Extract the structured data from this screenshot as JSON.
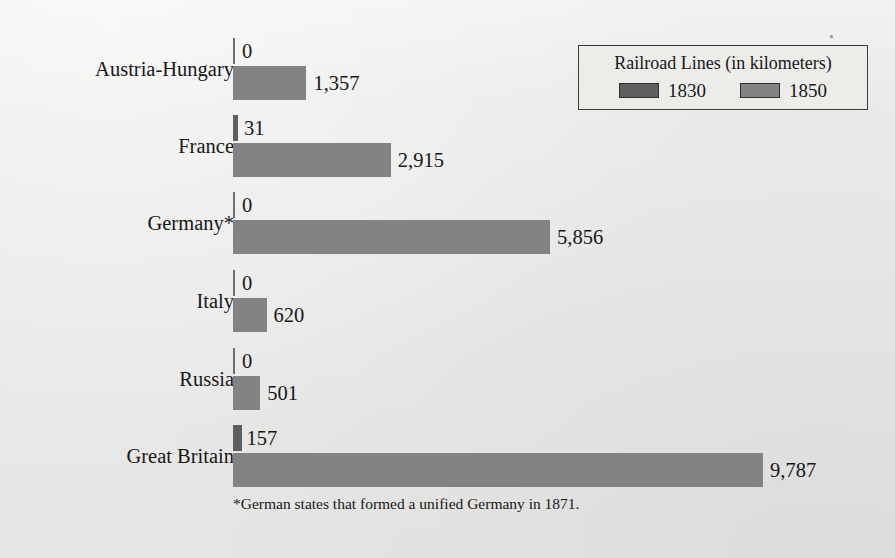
{
  "chart_data": {
    "type": "bar",
    "orientation": "horizontal",
    "title": "Railroad Lines (in kilometers)",
    "xlabel": "",
    "ylabel": "",
    "categories": [
      "Austria-Hungary",
      "France",
      "Germany*",
      "Italy",
      "Russia",
      "Great Britain"
    ],
    "series": [
      {
        "name": "1830",
        "color": "#5e5e5e",
        "values": [
          0,
          31,
          0,
          0,
          0,
          157
        ],
        "labels": [
          "0",
          "31",
          "0",
          "0",
          "0",
          "157"
        ]
      },
      {
        "name": "1850",
        "color": "#838383",
        "values": [
          1357,
          2915,
          5856,
          620,
          501,
          9787
        ],
        "labels": [
          "1,357",
          "2,915",
          "5,856",
          "620",
          "501",
          "9,787"
        ]
      }
    ],
    "xlim": [
      0,
      9787
    ],
    "grid": false,
    "legend_position": "top-right",
    "annotations": [
      "*German states that formed a unified Germany in 1871."
    ]
  },
  "legend": {
    "title": "Railroad Lines (in kilometers)",
    "entries": [
      {
        "label": "1830",
        "color": "#5e5e5e"
      },
      {
        "label": "1850",
        "color": "#838383"
      }
    ]
  },
  "footnote": "*German states that formed a unified Germany in 1871.",
  "colors": {
    "background": "#e9e9e7",
    "series_1830": "#5e5e5e",
    "series_1850": "#838383",
    "text": "#171717",
    "legend_border": "#3a3a3a",
    "axis_tick": "#6f6f6f"
  }
}
